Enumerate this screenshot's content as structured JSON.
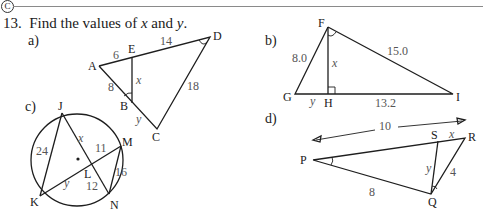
{
  "header": {
    "badge": "C",
    "question_number": "13.",
    "prompt_text": "Find the values of ",
    "prompt_x": "x",
    "prompt_and": " and ",
    "prompt_y": "y",
    "prompt_end": "."
  },
  "parts": {
    "a": {
      "label": "a)",
      "points": {
        "A": "A",
        "E": "E",
        "D": "D",
        "B": "B",
        "C": "C"
      },
      "measures": {
        "AE": "6",
        "ED": "14",
        "AB": "8",
        "DC": "18",
        "EB": "x",
        "BC": "y"
      }
    },
    "b": {
      "label": "b)",
      "points": {
        "F": "F",
        "G": "G",
        "H": "H",
        "I": "I"
      },
      "measures": {
        "FG": "8.0",
        "FI": "15.0",
        "HI": "13.2",
        "FH": "x",
        "GH": "y"
      }
    },
    "c": {
      "label": "c)",
      "points": {
        "J": "J",
        "K": "K",
        "L": "L",
        "M": "M",
        "N": "N"
      },
      "measures": {
        "JK": "24",
        "JL": "x",
        "LM": "11",
        "KL": "y",
        "LN": "12",
        "MN": "16"
      }
    },
    "d": {
      "label": "d)",
      "points": {
        "P": "P",
        "Q": "Q",
        "R": "R",
        "S": "S"
      },
      "measures": {
        "PR": "10",
        "SR": "x",
        "SQ": "y",
        "QR": "4",
        "PQ": "8"
      }
    }
  }
}
